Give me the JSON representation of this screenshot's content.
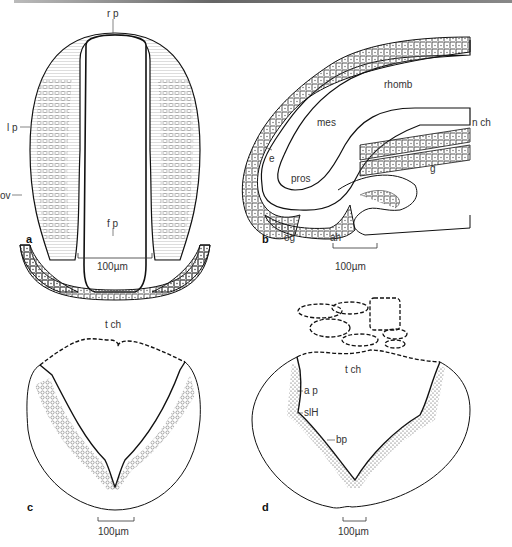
{
  "figure": {
    "panels": [
      {
        "id": "a",
        "letter": "a",
        "labels": {
          "rp": "r p",
          "lp": "l p",
          "ov": "ov",
          "fp": "f p"
        },
        "scale_bar": "100µm"
      },
      {
        "id": "b",
        "letter": "b",
        "labels": {
          "rhomb": "rhomb",
          "mes": "mes",
          "nch": "n ch",
          "e": "e",
          "pros": "pros",
          "g": "g",
          "og": "og",
          "ah": "ah"
        },
        "scale_bar": "100µm"
      },
      {
        "id": "c",
        "letter": "c",
        "labels": {
          "tch": "t ch"
        },
        "scale_bar": "100µm"
      },
      {
        "id": "d",
        "letter": "d",
        "labels": {
          "tch": "t ch",
          "ap": "a p",
          "slH": "slH",
          "bp": "bp"
        },
        "scale_bar": "100µm"
      }
    ]
  }
}
